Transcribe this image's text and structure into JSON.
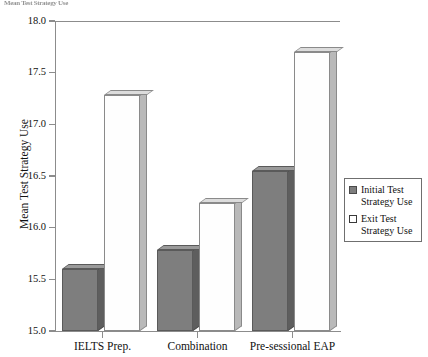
{
  "header_fragment": "Mean Test Strategy Use",
  "chart_data": {
    "type": "bar",
    "title": "",
    "subtitle": "",
    "xlabel": "",
    "ylabel": "Mean Test Strategy Use",
    "ylim": [
      15.0,
      18.0
    ],
    "ytick_labels": [
      "18.0",
      "17.5",
      "17.0",
      "16.5",
      "16.0",
      "15.5",
      "15.0"
    ],
    "ytick_values": [
      18.0,
      17.5,
      17.0,
      16.5,
      16.0,
      15.5,
      15.0
    ],
    "grid": false,
    "legend_position": "right",
    "categories": [
      "IELTS Prep.",
      "Combination",
      "Pre-sessional EAP"
    ],
    "series": [
      {
        "name": "Initial Test Strategy Use",
        "color": "#7e7e7e",
        "values": [
          15.6,
          15.78,
          16.55
        ]
      },
      {
        "name": "Exit Test Strategy Use",
        "color": "#ffffff",
        "values": [
          17.28,
          16.24,
          17.7
        ]
      }
    ]
  },
  "legend": {
    "items": [
      {
        "label_line1": "Initial Test",
        "label_line2": "Strategy Use",
        "swatch": "filled"
      },
      {
        "label_line1": "Exit Test",
        "label_line2": "Strategy Use",
        "swatch": "hollow"
      }
    ]
  }
}
